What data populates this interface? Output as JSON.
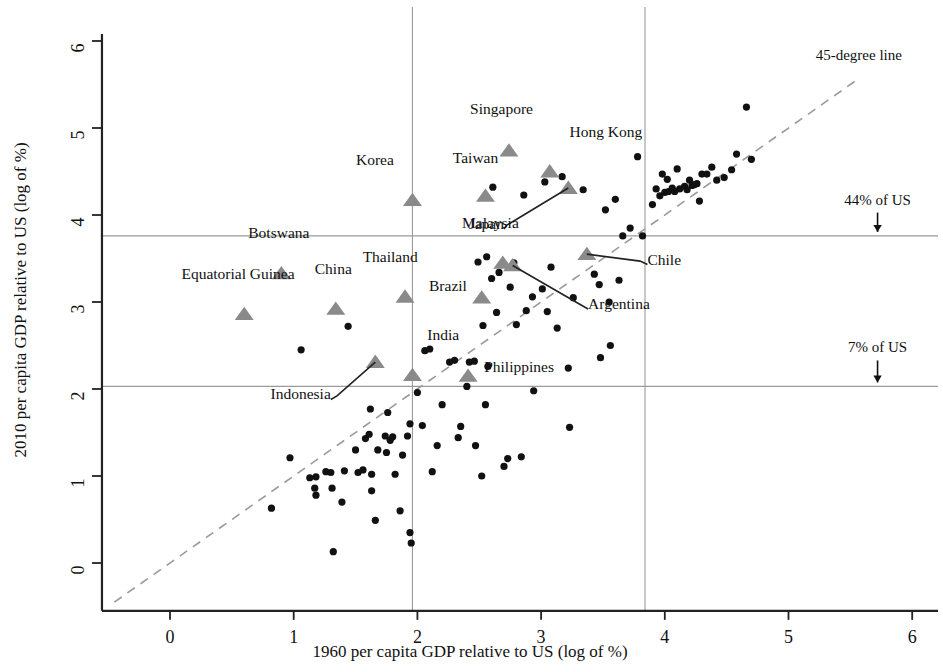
{
  "chart_data": {
    "type": "scatter",
    "title": "",
    "xlabel": "1960 per capita GDP relative to US (log of %)",
    "ylabel": "2010 per capita GDP relative to US (log of %)",
    "xlim": [
      -0.55,
      6.25
    ],
    "ylim": [
      -0.55,
      6.3
    ],
    "xticks": [
      0,
      1,
      2,
      3,
      4,
      5,
      6
    ],
    "yticks": [
      0,
      1,
      2,
      3,
      4,
      5,
      6
    ],
    "xticklabels": [
      "0",
      "1",
      "2",
      "3",
      "4",
      "5",
      "6"
    ],
    "yticklabels": [
      "0",
      "1",
      "2",
      "3",
      "4",
      "5",
      "6"
    ],
    "grid": false,
    "legend": "none",
    "marker_colors": {
      "highlighted_triangle": "#8a8a8a",
      "plain_dot": "#111111",
      "reference_line": "#9a9a9a",
      "diagonal_line": "#9a9a9a",
      "axis": "#222222",
      "leader_line": "#222222"
    },
    "reference_lines": {
      "horizontal": [
        {
          "y": 3.76,
          "label": "44% of US",
          "label_x": 5.72,
          "label_y": 4.12,
          "arrow": true
        },
        {
          "y": 2.03,
          "label": "7% of US",
          "label_x": 5.72,
          "label_y": 2.42,
          "arrow": true
        }
      ],
      "vertical": [
        {
          "x": 1.96
        },
        {
          "x": 3.84
        }
      ],
      "diagonal": {
        "label": "45-degree line",
        "label_x": 5.22,
        "label_y": 5.78,
        "from": [
          -0.45,
          -0.45
        ],
        "to": [
          5.55,
          5.55
        ]
      }
    },
    "highlighted": [
      {
        "name": "Singapore",
        "x": 2.74,
        "y": 4.74,
        "label_dx": -0.06,
        "label_dy": 0.42,
        "anchor": "middle"
      },
      {
        "name": "Hong Kong",
        "x": 3.07,
        "y": 4.5,
        "label_dx": 0.16,
        "label_dy": 0.4,
        "anchor": "start"
      },
      {
        "name": "Taiwan",
        "x": 2.55,
        "y": 4.22,
        "label_dx": -0.08,
        "label_dy": 0.38,
        "anchor": "middle"
      },
      {
        "name": "Korea",
        "x": 1.96,
        "y": 4.17,
        "label_dx": -0.15,
        "label_dy": 0.4,
        "anchor": "end"
      },
      {
        "name": "Japan",
        "x": 3.22,
        "y": 4.31,
        "leader_to": [
          2.72,
          3.88
        ],
        "label_dx": 0.0,
        "label_dy": 0.0,
        "anchor": "end",
        "label_abs": [
          2.7,
          3.84
        ]
      },
      {
        "name": "Malaysia",
        "x": 2.69,
        "y": 3.45,
        "label_dx": -0.1,
        "label_dy": 0.4,
        "anchor": "middle"
      },
      {
        "name": "Chile",
        "x": 3.37,
        "y": 3.55,
        "leader_to": [
          3.8,
          3.47
        ],
        "label_abs": [
          3.86,
          3.43
        ],
        "anchor": "start"
      },
      {
        "name": "Argentina",
        "x": 2.77,
        "y": 3.42,
        "leader_to": [
          3.33,
          2.96
        ],
        "label_abs": [
          3.38,
          2.92
        ],
        "anchor": "start"
      },
      {
        "name": "Botswana",
        "x": 0.9,
        "y": 3.33,
        "label_dx": -0.02,
        "label_dy": 0.4,
        "anchor": "middle"
      },
      {
        "name": "Thailand",
        "x": 1.9,
        "y": 3.06,
        "label_dx": -0.12,
        "label_dy": 0.4,
        "anchor": "middle"
      },
      {
        "name": "Brazil",
        "x": 2.52,
        "y": 3.05,
        "label_dx": -0.12,
        "label_dy": 0.08,
        "anchor": "end"
      },
      {
        "name": "China",
        "x": 1.34,
        "y": 2.92,
        "label_dx": -0.02,
        "label_dy": 0.4,
        "anchor": "middle"
      },
      {
        "name": "Equatorial Guinea",
        "x": 0.6,
        "y": 2.86,
        "label_dx": -0.05,
        "label_dy": 0.4,
        "anchor": "middle"
      },
      {
        "name": "India",
        "x": 1.96,
        "y": 2.16,
        "label_dx": 0.12,
        "label_dy": 0.4,
        "anchor": "start"
      },
      {
        "name": "Indonesia",
        "x": 1.66,
        "y": 2.31,
        "leader_to": [
          1.35,
          1.92
        ],
        "label_abs": [
          1.3,
          1.88
        ],
        "anchor": "end"
      },
      {
        "name": "Philippines",
        "x": 2.41,
        "y": 2.15,
        "label_dx": 0.13,
        "label_dy": 0.05,
        "anchor": "start"
      }
    ],
    "points": [
      [
        0.82,
        0.63
      ],
      [
        0.97,
        1.21
      ],
      [
        1.06,
        2.45
      ],
      [
        1.13,
        0.98
      ],
      [
        1.18,
        0.99
      ],
      [
        1.18,
        0.78
      ],
      [
        1.17,
        0.86
      ],
      [
        1.26,
        1.05
      ],
      [
        1.3,
        1.04
      ],
      [
        1.31,
        0.86
      ],
      [
        1.32,
        0.13
      ],
      [
        1.39,
        0.7
      ],
      [
        1.41,
        1.06
      ],
      [
        1.44,
        2.72
      ],
      [
        1.5,
        1.3
      ],
      [
        1.52,
        1.04
      ],
      [
        1.56,
        1.07
      ],
      [
        1.58,
        1.43
      ],
      [
        1.61,
        1.48
      ],
      [
        1.62,
        1.77
      ],
      [
        1.63,
        1.02
      ],
      [
        1.63,
        0.83
      ],
      [
        1.66,
        0.49
      ],
      [
        1.68,
        1.3
      ],
      [
        1.74,
        1.46
      ],
      [
        1.75,
        1.27
      ],
      [
        1.76,
        1.73
      ],
      [
        1.78,
        1.41
      ],
      [
        1.8,
        1.45
      ],
      [
        1.82,
        1.02
      ],
      [
        1.86,
        0.6
      ],
      [
        1.88,
        1.24
      ],
      [
        1.92,
        1.46
      ],
      [
        1.94,
        1.6
      ],
      [
        1.94,
        0.35
      ],
      [
        1.95,
        0.23
      ],
      [
        2.0,
        1.96
      ],
      [
        2.04,
        1.58
      ],
      [
        2.06,
        2.44
      ],
      [
        2.1,
        2.46
      ],
      [
        2.12,
        1.05
      ],
      [
        2.16,
        1.35
      ],
      [
        2.2,
        1.82
      ],
      [
        2.26,
        2.31
      ],
      [
        2.3,
        2.33
      ],
      [
        2.33,
        1.44
      ],
      [
        2.35,
        1.57
      ],
      [
        2.4,
        2.03
      ],
      [
        2.42,
        2.31
      ],
      [
        2.46,
        2.32
      ],
      [
        2.47,
        1.35
      ],
      [
        2.49,
        3.46
      ],
      [
        2.52,
        1.0
      ],
      [
        2.53,
        2.73
      ],
      [
        2.55,
        1.82
      ],
      [
        2.56,
        3.52
      ],
      [
        2.57,
        2.26
      ],
      [
        2.6,
        3.27
      ],
      [
        2.61,
        4.32
      ],
      [
        2.64,
        2.88
      ],
      [
        2.66,
        3.34
      ],
      [
        2.7,
        1.11
      ],
      [
        2.73,
        1.2
      ],
      [
        2.75,
        3.17
      ],
      [
        2.78,
        3.45
      ],
      [
        2.8,
        2.74
      ],
      [
        2.84,
        1.22
      ],
      [
        2.86,
        4.23
      ],
      [
        2.88,
        2.9
      ],
      [
        2.93,
        3.06
      ],
      [
        2.94,
        1.98
      ],
      [
        3.01,
        3.15
      ],
      [
        3.03,
        4.38
      ],
      [
        3.05,
        2.89
      ],
      [
        3.08,
        3.4
      ],
      [
        3.13,
        2.7
      ],
      [
        3.17,
        4.44
      ],
      [
        3.22,
        2.24
      ],
      [
        3.23,
        1.56
      ],
      [
        3.26,
        3.05
      ],
      [
        3.34,
        4.29
      ],
      [
        3.43,
        3.32
      ],
      [
        3.47,
        3.2
      ],
      [
        3.48,
        2.36
      ],
      [
        3.52,
        4.06
      ],
      [
        3.56,
        2.5
      ],
      [
        3.6,
        4.18
      ],
      [
        3.63,
        3.25
      ],
      [
        3.66,
        3.76
      ],
      [
        3.72,
        3.85
      ],
      [
        3.78,
        4.67
      ],
      [
        3.82,
        3.76
      ],
      [
        3.9,
        4.12
      ],
      [
        3.93,
        4.3
      ],
      [
        3.96,
        4.22
      ],
      [
        3.98,
        4.47
      ],
      [
        4.0,
        4.26
      ],
      [
        4.02,
        4.41
      ],
      [
        4.03,
        4.27
      ],
      [
        4.06,
        4.31
      ],
      [
        4.08,
        4.27
      ],
      [
        4.1,
        4.53
      ],
      [
        4.12,
        4.3
      ],
      [
        4.16,
        4.33
      ],
      [
        4.18,
        4.29
      ],
      [
        4.2,
        4.4
      ],
      [
        4.22,
        4.34
      ],
      [
        4.24,
        4.35
      ],
      [
        4.26,
        4.36
      ],
      [
        4.28,
        4.16
      ],
      [
        4.3,
        4.47
      ],
      [
        4.34,
        4.47
      ],
      [
        4.38,
        4.55
      ],
      [
        4.42,
        4.4
      ],
      [
        4.48,
        4.43
      ],
      [
        4.54,
        4.52
      ],
      [
        4.58,
        4.7
      ],
      [
        4.66,
        5.24
      ],
      [
        4.7,
        4.64
      ],
      [
        3.55,
        3.0
      ]
    ]
  }
}
